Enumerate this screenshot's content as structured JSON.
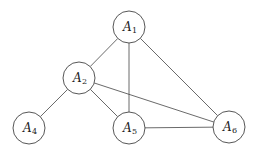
{
  "diagram": {
    "type": "undirected-graph",
    "nodes": [
      {
        "id": "A1",
        "base": "A",
        "sub": "1",
        "x": 129,
        "y": 27
      },
      {
        "id": "A2",
        "base": "A",
        "sub": "2",
        "x": 79,
        "y": 78
      },
      {
        "id": "A4",
        "base": "A",
        "sub": "4",
        "x": 29,
        "y": 128
      },
      {
        "id": "A5",
        "base": "A",
        "sub": "5",
        "x": 129,
        "y": 128
      },
      {
        "id": "A6",
        "base": "A",
        "sub": "6",
        "x": 229,
        "y": 127
      }
    ],
    "edges": [
      [
        "A1",
        "A2"
      ],
      [
        "A1",
        "A5"
      ],
      [
        "A1",
        "A6"
      ],
      [
        "A2",
        "A4"
      ],
      [
        "A2",
        "A5"
      ],
      [
        "A2",
        "A6"
      ],
      [
        "A5",
        "A6"
      ]
    ],
    "node_radius": 16,
    "stroke_color": "#444444",
    "fill_color": "#ffffff"
  }
}
